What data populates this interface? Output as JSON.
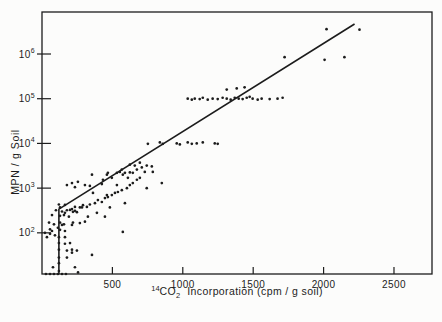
{
  "figure": {
    "paper_color": "#fcfcfb",
    "ink_color": "#1c1c1c"
  },
  "chart_data": {
    "type": "scatter",
    "title": "",
    "ylabel": "MPN / g Soil",
    "xlabel": {
      "sup": "14",
      "main": "CO",
      "sub": "2",
      "rest": "Incorporation (cpm / g soil)"
    },
    "x_axis": {
      "min": 0,
      "max": 2770,
      "ticks": [
        500,
        1000,
        1500,
        2000,
        2500
      ],
      "tick_labels": [
        "500",
        "1000",
        "1500",
        "2000",
        "2500"
      ]
    },
    "y_axis": {
      "scale": "log",
      "min": 12,
      "max": 8700000,
      "tick_label_base": "10",
      "tick_exponents": [
        "2",
        "3",
        "4",
        "5",
        "6"
      ]
    },
    "fit_line": {
      "comment_visible_shape_only": "vertical segment at low cpm joining regression line",
      "vertical_x": 120,
      "vertical_bottom_mpn": 12,
      "kink": [
        120,
        340
      ],
      "end": [
        2220,
        4700000
      ]
    },
    "points": [
      [
        21,
        100
      ],
      [
        35,
        80
      ],
      [
        50,
        170
      ],
      [
        57,
        120
      ],
      [
        57,
        95
      ],
      [
        71,
        250
      ],
      [
        71,
        110
      ],
      [
        78,
        17
      ],
      [
        85,
        155
      ],
      [
        92,
        88
      ],
      [
        99,
        320
      ],
      [
        113,
        130
      ],
      [
        120,
        430
      ],
      [
        120,
        80
      ],
      [
        120,
        59
      ],
      [
        120,
        42
      ],
      [
        120,
        28
      ],
      [
        120,
        21
      ],
      [
        120,
        14
      ],
      [
        128,
        370
      ],
      [
        128,
        240
      ],
      [
        128,
        170
      ],
      [
        128,
        117
      ],
      [
        142,
        300
      ],
      [
        142,
        150
      ],
      [
        156,
        250
      ],
      [
        156,
        155
      ],
      [
        163,
        420
      ],
      [
        163,
        110
      ],
      [
        163,
        80
      ],
      [
        163,
        57
      ],
      [
        177,
        320
      ],
      [
        177,
        40
      ],
      [
        177,
        28
      ],
      [
        191,
        230
      ],
      [
        199,
        59
      ],
      [
        213,
        340
      ],
      [
        213,
        150
      ],
      [
        213,
        42
      ],
      [
        213,
        36
      ],
      [
        234,
        310
      ],
      [
        234,
        17
      ],
      [
        248,
        290
      ],
      [
        248,
        40
      ],
      [
        256,
        13
      ],
      [
        269,
        165
      ],
      [
        284,
        370
      ],
      [
        28,
        12
      ],
      [
        57,
        12
      ],
      [
        85,
        12
      ],
      [
        113,
        12
      ],
      [
        142,
        12
      ],
      [
        170,
        12
      ],
      [
        163,
        280
      ],
      [
        177,
        1170
      ],
      [
        199,
        325
      ],
      [
        213,
        1300
      ],
      [
        220,
        295
      ],
      [
        220,
        170
      ],
      [
        234,
        380
      ],
      [
        234,
        1050
      ],
      [
        255,
        1380
      ],
      [
        269,
        370
      ],
      [
        291,
        415
      ],
      [
        305,
        1170
      ],
      [
        305,
        178
      ],
      [
        319,
        380
      ],
      [
        326,
        230
      ],
      [
        340,
        430
      ],
      [
        340,
        1120
      ],
      [
        355,
        2000
      ],
      [
        355,
        32
      ],
      [
        362,
        780
      ],
      [
        376,
        460
      ],
      [
        390,
        280
      ],
      [
        397,
        540
      ],
      [
        425,
        1230
      ],
      [
        425,
        490
      ],
      [
        433,
        1540
      ],
      [
        447,
        600
      ],
      [
        447,
        230
      ],
      [
        461,
        2000
      ],
      [
        461,
        700
      ],
      [
        468,
        630
      ],
      [
        468,
        2200
      ],
      [
        482,
        370
      ],
      [
        496,
        700
      ],
      [
        496,
        1700
      ],
      [
        518,
        780
      ],
      [
        532,
        2200
      ],
      [
        532,
        1170
      ],
      [
        539,
        820
      ],
      [
        553,
        2300
      ],
      [
        567,
        900
      ],
      [
        567,
        2600
      ],
      [
        574,
        2000
      ],
      [
        574,
        105
      ],
      [
        589,
        2200
      ],
      [
        589,
        460
      ],
      [
        603,
        1000
      ],
      [
        610,
        1700
      ],
      [
        624,
        1170
      ],
      [
        624,
        2250
      ],
      [
        624,
        3350
      ],
      [
        645,
        2200
      ],
      [
        645,
        1300
      ],
      [
        659,
        3200
      ],
      [
        674,
        1540
      ],
      [
        674,
        2600
      ],
      [
        695,
        1700
      ],
      [
        695,
        3700
      ],
      [
        709,
        2900
      ],
      [
        730,
        2300
      ],
      [
        744,
        3200
      ],
      [
        744,
        1000
      ],
      [
        780,
        3050
      ],
      [
        787,
        2300
      ],
      [
        851,
        1300
      ],
      [
        752,
        9800
      ],
      [
        837,
        10500
      ],
      [
        858,
        9800
      ],
      [
        957,
        10000
      ],
      [
        979,
        9500
      ],
      [
        1035,
        10500
      ],
      [
        1064,
        9800
      ],
      [
        1099,
        10000
      ],
      [
        1142,
        10500
      ],
      [
        1227,
        10000
      ],
      [
        1248,
        9800
      ],
      [
        1035,
        100000
      ],
      [
        1064,
        95000
      ],
      [
        1085,
        100000
      ],
      [
        1120,
        98000
      ],
      [
        1142,
        105000
      ],
      [
        1177,
        95000
      ],
      [
        1212,
        100000
      ],
      [
        1248,
        98000
      ],
      [
        1283,
        105000
      ],
      [
        1312,
        100000
      ],
      [
        1340,
        95000
      ],
      [
        1369,
        105000
      ],
      [
        1397,
        100000
      ],
      [
        1425,
        98000
      ],
      [
        1454,
        105000
      ],
      [
        1475,
        110000
      ],
      [
        1496,
        100000
      ],
      [
        1532,
        95000
      ],
      [
        1560,
        100000
      ],
      [
        1617,
        98000
      ],
      [
        1673,
        100000
      ],
      [
        1709,
        105000
      ],
      [
        1312,
        160000
      ],
      [
        1383,
        170000
      ],
      [
        1439,
        180000
      ],
      [
        1723,
        850000
      ],
      [
        2007,
        740000
      ],
      [
        2021,
        3600000
      ],
      [
        2148,
        850000
      ],
      [
        2255,
        3500000
      ]
    ]
  }
}
